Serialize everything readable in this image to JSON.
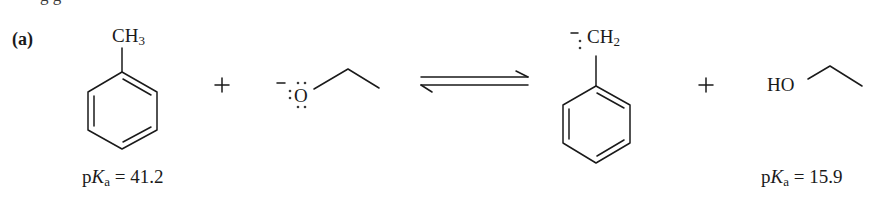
{
  "figure": {
    "part_label": "(a)",
    "cutoff_text": "g                g",
    "reactants": [
      {
        "name": "toluene",
        "substituent_label": "CH",
        "substituent_subscript": "3",
        "pka_prefix": "p",
        "pka_K": "K",
        "pka_sub": "a",
        "pka_value": " = 41.2"
      },
      {
        "name": "ethoxide",
        "charge": "−",
        "atom": "O"
      }
    ],
    "operator_plus_1": "+",
    "arrow": "equilibrium",
    "products": [
      {
        "name": "benzyl anion",
        "charge": "−",
        "lone_pair": ":",
        "substituent_label": "CH",
        "substituent_subscript": "2"
      },
      {
        "name": "ethanol",
        "atom_label": "HO",
        "pka_prefix": "p",
        "pka_K": "K",
        "pka_sub": "a",
        "pka_value": " = 15.9"
      }
    ],
    "operator_plus_2": "+"
  }
}
